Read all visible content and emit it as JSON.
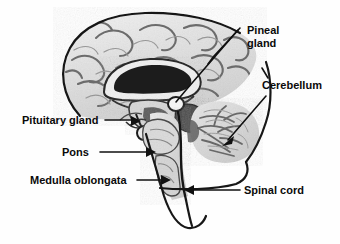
{
  "figure": {
    "kind": "anatomical-diagram",
    "background_color": "#fefefe",
    "line_color": "#171717",
    "text_color": "#0a0a0a"
  },
  "labels": {
    "pineal_gland": {
      "line1": "Pineal",
      "line2": "gland",
      "x": 247,
      "y": 34
    },
    "cerebellum": {
      "text": "Cerebellum",
      "x": 262,
      "y": 89
    },
    "pituitary_gland": {
      "text": "Pituitary gland",
      "x": 22,
      "y": 124
    },
    "pons": {
      "text": "Pons",
      "x": 62,
      "y": 156
    },
    "medulla_oblongata": {
      "text": "Medulla oblongata",
      "x": 30,
      "y": 184
    },
    "spinal_cord": {
      "text": "Spinal cord",
      "x": 244,
      "y": 194
    }
  }
}
